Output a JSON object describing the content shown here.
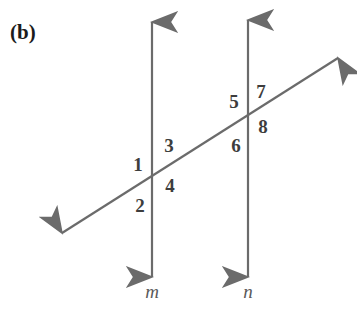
{
  "figure": {
    "part_label": "(b)",
    "caption_hidden": "",
    "background_color": "#ffffff",
    "stroke_color": "#6b6b6b",
    "label_color": "#3d3d3d",
    "part_label_color": "#1b1b1b",
    "line_label_color": "#5a5a5a"
  },
  "lines": [
    {
      "id": "line-m",
      "name": "m",
      "label": "m",
      "orientation": "vertical",
      "x1": 152,
      "y1": 22,
      "x2": 152,
      "y2": 277,
      "arrow_start": true,
      "arrow_end": true,
      "label_x": 152,
      "label_y": 292
    },
    {
      "id": "line-n",
      "name": "n",
      "label": "n",
      "orientation": "vertical",
      "x1": 248,
      "y1": 20,
      "x2": 248,
      "y2": 277,
      "arrow_start": true,
      "arrow_end": true,
      "label_x": 248,
      "label_y": 292
    },
    {
      "id": "transversal",
      "name": "transversal",
      "label": "",
      "orientation": "diagonal",
      "x1": 62,
      "y1": 233,
      "x2": 338,
      "y2": 58,
      "arrow_start": true,
      "arrow_end": true,
      "label_x": 0,
      "label_y": 0
    }
  ],
  "intersections": [
    {
      "id": "intersection-m",
      "x": 152,
      "y": 182
    },
    {
      "id": "intersection-n",
      "x": 248,
      "y": 128
    }
  ],
  "angles": [
    {
      "id": "angle-1",
      "label": "1",
      "x": 138,
      "y": 165,
      "intersection": "intersection-m",
      "position": "upper-left"
    },
    {
      "id": "angle-2",
      "label": "2",
      "x": 140,
      "y": 206,
      "intersection": "intersection-m",
      "position": "lower-left"
    },
    {
      "id": "angle-3",
      "label": "3",
      "x": 169,
      "y": 146,
      "intersection": "intersection-m",
      "position": "upper-right"
    },
    {
      "id": "angle-4",
      "label": "4",
      "x": 170,
      "y": 186,
      "intersection": "intersection-m",
      "position": "lower-right"
    },
    {
      "id": "angle-5",
      "label": "5",
      "x": 234,
      "y": 102,
      "intersection": "intersection-n",
      "position": "upper-left"
    },
    {
      "id": "angle-6",
      "label": "6",
      "x": 236,
      "y": 146,
      "intersection": "intersection-n",
      "position": "lower-left"
    },
    {
      "id": "angle-7",
      "label": "7",
      "x": 261,
      "y": 92,
      "intersection": "intersection-n",
      "position": "upper-right"
    },
    {
      "id": "angle-8",
      "label": "8",
      "x": 263,
      "y": 127,
      "intersection": "intersection-n",
      "position": "lower-right"
    }
  ],
  "part_label_position": {
    "x": 10,
    "y": 22
  }
}
